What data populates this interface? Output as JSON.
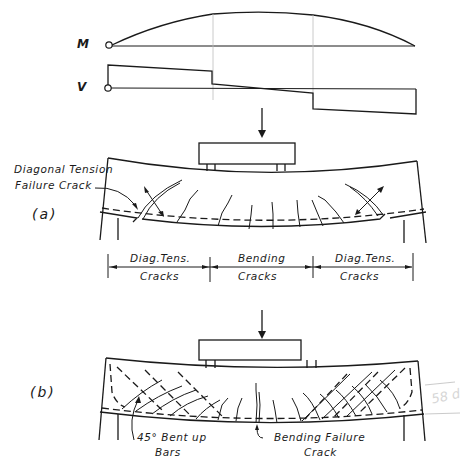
{
  "figure": {
    "moment_diagram": {
      "label": "M"
    },
    "shear_diagram": {
      "label": "V"
    },
    "case_a": {
      "label": "(a)",
      "annotation": [
        "Diagonal Tension",
        "Failure Crack"
      ],
      "zones": [
        {
          "line1": "Diag.Tens.",
          "line2": "Cracks"
        },
        {
          "line1": "Bending",
          "line2": "Cracks"
        },
        {
          "line1": "Diag.Tens.",
          "line2": "Cracks"
        }
      ]
    },
    "case_b": {
      "label": "(b)",
      "annotation_left": [
        "45° Bent up",
        "Bars"
      ],
      "annotation_right": [
        "Bending Failure",
        "Crack"
      ],
      "margin_note": "58 d"
    }
  }
}
